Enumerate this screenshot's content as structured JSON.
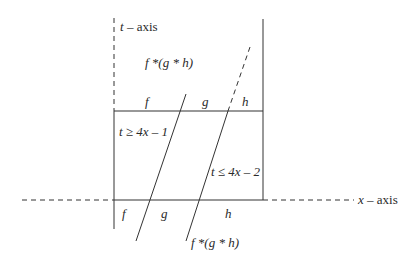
{
  "axes": {
    "t_axis_label": {
      "var": "t",
      "rest": " – axis"
    },
    "x_axis_label": {
      "var": "x",
      "rest": " – axis"
    }
  },
  "top_region": {
    "formula": "f *(g * h)",
    "labels": [
      "f",
      "g",
      "h"
    ]
  },
  "middle_region": {
    "inequality_left": "t ≥ 4x – 1",
    "inequality_right": "t ≤ 4x – 2"
  },
  "bottom_region": {
    "labels": [
      "f",
      "g",
      "h"
    ],
    "formula": "f *(g * h)"
  },
  "colors": {
    "line": "#333333",
    "text": "#2a2a2a"
  }
}
